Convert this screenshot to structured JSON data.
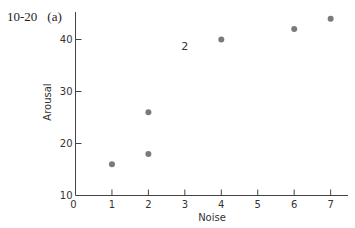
{
  "figure": {
    "number": "10-20",
    "panel": "(a)"
  },
  "chart_data": {
    "type": "scatter",
    "title": "",
    "xlabel": "Noise",
    "ylabel": "Arousal",
    "xlim": [
      0,
      7.5
    ],
    "ylim": [
      10,
      45
    ],
    "xticks": [
      0,
      1,
      2,
      3,
      4,
      5,
      6,
      7
    ],
    "yticks": [
      10,
      20,
      30,
      40
    ],
    "grid": false,
    "legend": null,
    "points": [
      {
        "x": 1,
        "y": 16
      },
      {
        "x": 2,
        "y": 18
      },
      {
        "x": 2,
        "y": 26
      },
      {
        "x": 4,
        "y": 40
      },
      {
        "x": 6,
        "y": 42
      },
      {
        "x": 7,
        "y": 44
      }
    ],
    "annotations": [
      {
        "text": "2",
        "x": 3,
        "y": 38
      }
    ],
    "marker_color": "#7a7a7a"
  }
}
